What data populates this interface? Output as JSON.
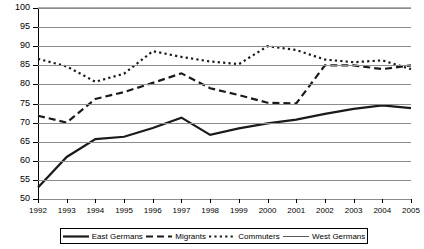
{
  "chart_data": {
    "type": "line",
    "title": "",
    "xlabel": "",
    "ylabel": "",
    "x": [
      1992,
      1993,
      1994,
      1995,
      1996,
      1997,
      1998,
      1999,
      2000,
      2001,
      2002,
      2003,
      2004,
      2005
    ],
    "xtick_labels": [
      "1992",
      "1993",
      "1994",
      "1995",
      "1996",
      "1997",
      "1998",
      "1999",
      "2000",
      "2001",
      "2002",
      "2003",
      "2004",
      "2005"
    ],
    "ytick_labels": [
      "50",
      "55",
      "60",
      "65",
      "70",
      "75",
      "80",
      "85",
      "90",
      "95",
      "100"
    ],
    "ylim": [
      50,
      100
    ],
    "ytick_step": 5,
    "grid": true,
    "legend_position": "bottom",
    "series": [
      {
        "name": "East Germans",
        "style": "solid",
        "color": "#1a1a1a",
        "values": [
          53.0,
          61.0,
          65.7,
          66.3,
          68.6,
          71.3,
          66.8,
          68.5,
          69.8,
          70.8,
          72.3,
          73.6,
          74.5,
          73.8
        ]
      },
      {
        "name": "Migrants",
        "style": "long-dash",
        "color": "#1a1a1a",
        "values": [
          71.8,
          70.0,
          76.2,
          78.0,
          80.4,
          82.9,
          79.0,
          77.2,
          75.2,
          75.0,
          85.0,
          85.0,
          84.0,
          85.0
        ]
      },
      {
        "name": "Commuters",
        "style": "dotted",
        "color": "#1a1a1a",
        "values": [
          86.7,
          84.7,
          80.7,
          82.8,
          88.7,
          87.2,
          86.0,
          85.3,
          90.0,
          89.0,
          86.5,
          85.8,
          86.3,
          84.0
        ]
      },
      {
        "name": "West Germans",
        "style": "thin-solid",
        "color": "#595959",
        "values": [
          100,
          100,
          100,
          100,
          100,
          100,
          100,
          100,
          100,
          100,
          100,
          100,
          100,
          100
        ]
      }
    ]
  },
  "legend": {
    "items": [
      {
        "label": "East Germans",
        "swatch": "solid-thick-line-swatch"
      },
      {
        "label": "Migrants",
        "swatch": "long-dash-line-swatch"
      },
      {
        "label": "Commuters",
        "swatch": "dotted-line-swatch"
      },
      {
        "label": "West Germans",
        "swatch": "thin-solid-line-swatch"
      }
    ]
  }
}
